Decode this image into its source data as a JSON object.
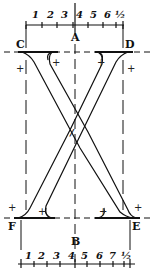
{
  "diagram": {
    "letter": "X",
    "points": {
      "A": "A",
      "B": "B",
      "C": "C",
      "D": "D",
      "E": "E",
      "F": "F"
    },
    "top_ruler": {
      "labels": [
        "1",
        "2",
        "3",
        "4",
        "5",
        "6",
        "½"
      ]
    },
    "bottom_ruler": {
      "labels": [
        "1",
        "2",
        "3",
        "4",
        "5",
        "6",
        "7",
        "½"
      ]
    },
    "center_mark": "/",
    "plus_mark": "+",
    "colors": {
      "ink": "#111111",
      "background": "#ffffff"
    }
  }
}
